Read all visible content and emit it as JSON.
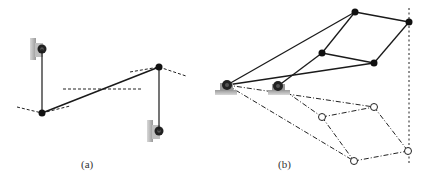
{
  "figure": {
    "panel_a": {
      "label": "(a)"
    },
    "panel_b": {
      "label": "(b)"
    }
  },
  "colors": {
    "link": "#1a1a1a",
    "joint": "#111111",
    "ground": "#8a8a8a",
    "background": "#ffffff"
  }
}
